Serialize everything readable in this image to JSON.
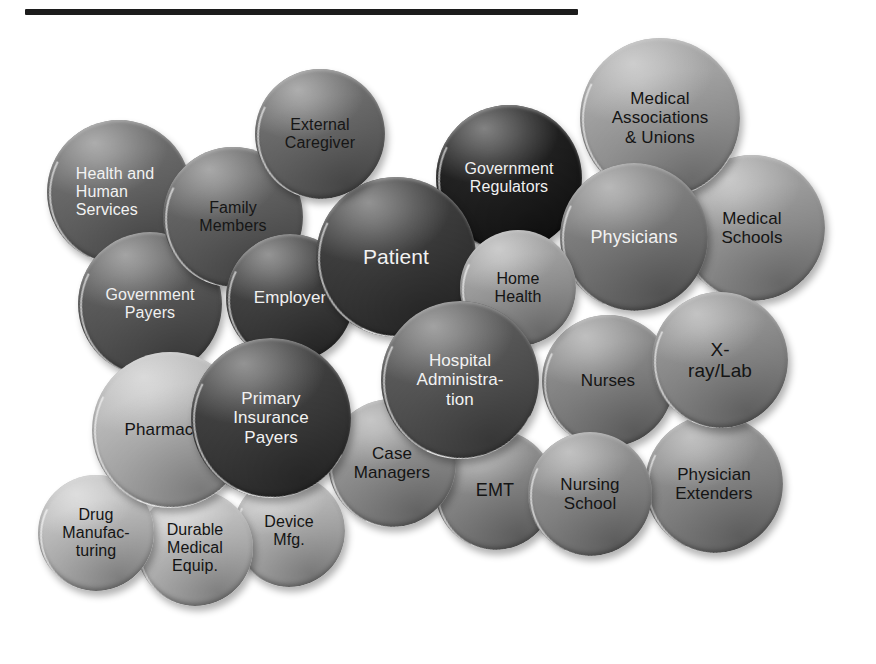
{
  "figure": {
    "title_rule": {
      "x": 25,
      "y": 9,
      "width": 553,
      "height": 6,
      "color": "#1c1c1c"
    },
    "background": "#ffffff",
    "text_light": "#f2f2f2",
    "text_dark": "#1a1a1a"
  },
  "chart_data": {
    "type": "diagram",
    "title": "",
    "categories": [
      "Health and Human Services",
      "External Caregiver",
      "Family Members",
      "Government Regulators",
      "Medical Associations & Unions",
      "Medical Schools",
      "Patient",
      "Physicians",
      "Government Payers",
      "Employer",
      "Home Health",
      "Hospital Administration",
      "X-ray/Lab",
      "Nurses",
      "Primary Insurance Payers",
      "Pharmacies",
      "Case Managers",
      "EMT",
      "Nursing School",
      "Physician Extenders",
      "Drug Manufacturing",
      "Durable Medical Equip.",
      "Device Mfg."
    ],
    "legend": [],
    "grid": false
  },
  "nodes": [
    {
      "id": "health-and-human-services",
      "label": "Health and\nHuman\nServices",
      "cx": 119,
      "cy": 192,
      "r": 72,
      "fill": "#686868",
      "text_color": "#f2f2f2",
      "font_size": 16,
      "align": "left",
      "z": 10
    },
    {
      "id": "external-caregiver",
      "label": "External\nCaregiver",
      "cx": 320,
      "cy": 134,
      "r": 65,
      "fill": "#6a6a6a",
      "text_color": "#161616",
      "font_size": 16,
      "align": "center",
      "z": 22
    },
    {
      "id": "family-members",
      "label": "Family\nMembers",
      "cx": 233,
      "cy": 217,
      "r": 70,
      "fill": "#616161",
      "text_color": "#161616",
      "font_size": 16,
      "align": "center",
      "z": 14
    },
    {
      "id": "government-regulators",
      "label": "Government\nRegulators",
      "cx": 509,
      "cy": 178,
      "r": 73,
      "fill": "#1f1f1f",
      "text_color": "#f0f0f0",
      "font_size": 16,
      "align": "center",
      "z": 12
    },
    {
      "id": "medical-associations-unions",
      "label": "Medical\nAssociations\n& Unions",
      "cx": 660,
      "cy": 118,
      "r": 80,
      "fill": "#a0a0a0",
      "text_color": "#141414",
      "font_size": 17,
      "align": "center",
      "z": 11
    },
    {
      "id": "medical-schools",
      "label": "Medical\nSchools",
      "cx": 752,
      "cy": 228,
      "r": 73,
      "fill": "#9a9a9a",
      "text_color": "#141414",
      "font_size": 17,
      "align": "center",
      "z": 10
    },
    {
      "id": "patient",
      "label": "Patient",
      "cx": 396,
      "cy": 257,
      "r": 80,
      "fill": "#3b3b3b",
      "text_color": "#f2f2f2",
      "font_size": 21,
      "align": "center",
      "z": 20
    },
    {
      "id": "physicians",
      "label": "Physicians",
      "cx": 634,
      "cy": 237,
      "r": 74,
      "fill": "#7c7c7c",
      "text_color": "#f2f2f2",
      "font_size": 18,
      "align": "center",
      "z": 20
    },
    {
      "id": "government-payers",
      "label": "Government\nPayers",
      "cx": 150,
      "cy": 304,
      "r": 72,
      "fill": "#595959",
      "text_color": "#f0f0f0",
      "font_size": 16,
      "align": "center",
      "z": 12
    },
    {
      "id": "employer",
      "label": "Employer",
      "cx": 290,
      "cy": 298,
      "r": 64,
      "fill": "#3f3f3f",
      "text_color": "#f0f0f0",
      "font_size": 17,
      "align": "center",
      "z": 18
    },
    {
      "id": "home-health",
      "label": "Home\nHealth",
      "cx": 518,
      "cy": 288,
      "r": 58,
      "fill": "#9d9d9d",
      "text_color": "#141414",
      "font_size": 16,
      "align": "center",
      "z": 24
    },
    {
      "id": "hospital-administration",
      "label": "Hospital\nAdministra-\ntion",
      "cx": 460,
      "cy": 380,
      "r": 79,
      "fill": "#565656",
      "text_color": "#f2f2f2",
      "font_size": 17,
      "align": "center",
      "z": 24
    },
    {
      "id": "x-ray-lab",
      "label": "X-\nray/Lab",
      "cx": 720,
      "cy": 360,
      "r": 68,
      "fill": "#8f8f8f",
      "text_color": "#141414",
      "font_size": 19,
      "align": "center",
      "z": 22
    },
    {
      "id": "nurses",
      "label": "Nurses",
      "cx": 608,
      "cy": 381,
      "r": 66,
      "fill": "#888888",
      "text_color": "#141414",
      "font_size": 17,
      "align": "center",
      "z": 18
    },
    {
      "id": "primary-insurance-payers",
      "label": "Primary\nInsurance\nPayers",
      "cx": 271,
      "cy": 418,
      "r": 80,
      "fill": "#3d3d3d",
      "text_color": "#f2f2f2",
      "font_size": 17,
      "align": "center",
      "z": 26
    },
    {
      "id": "pharmacies",
      "label": "Pharmacies",
      "cx": 170,
      "cy": 430,
      "r": 78,
      "fill": "#b6b6b6",
      "text_color": "#141414",
      "font_size": 17,
      "align": "center",
      "z": 16
    },
    {
      "id": "case-managers",
      "label": "Case\nManagers",
      "cx": 392,
      "cy": 463,
      "r": 64,
      "fill": "#949494",
      "text_color": "#141414",
      "font_size": 17,
      "align": "center",
      "z": 20
    },
    {
      "id": "emt",
      "label": "EMT",
      "cx": 495,
      "cy": 490,
      "r": 60,
      "fill": "#8a8a8a",
      "text_color": "#141414",
      "font_size": 18,
      "align": "center",
      "z": 18
    },
    {
      "id": "nursing-school",
      "label": "Nursing\nSchool",
      "cx": 590,
      "cy": 494,
      "r": 62,
      "fill": "#8c8c8c",
      "text_color": "#141414",
      "font_size": 17,
      "align": "center",
      "z": 18
    },
    {
      "id": "physician-extenders",
      "label": "Physician\nExtenders",
      "cx": 714,
      "cy": 484,
      "r": 69,
      "fill": "#8b8b8b",
      "text_color": "#141414",
      "font_size": 17,
      "align": "center",
      "z": 16
    },
    {
      "id": "drug-manufacturing",
      "label": "Drug\nManufac-\nturing",
      "cx": 96,
      "cy": 533,
      "r": 58,
      "fill": "#bcbcbc",
      "text_color": "#141414",
      "font_size": 16,
      "align": "center",
      "z": 14
    },
    {
      "id": "durable-medical-equip",
      "label": "Durable\nMedical\nEquip.",
      "cx": 195,
      "cy": 548,
      "r": 58,
      "fill": "#bdbdbd",
      "text_color": "#141414",
      "font_size": 16,
      "align": "center",
      "z": 12
    },
    {
      "id": "device-mfg",
      "label": "Device\nMfg.",
      "cx": 289,
      "cy": 531,
      "r": 56,
      "fill": "#b4b4b4",
      "text_color": "#141414",
      "font_size": 16,
      "align": "center",
      "z": 10
    }
  ]
}
